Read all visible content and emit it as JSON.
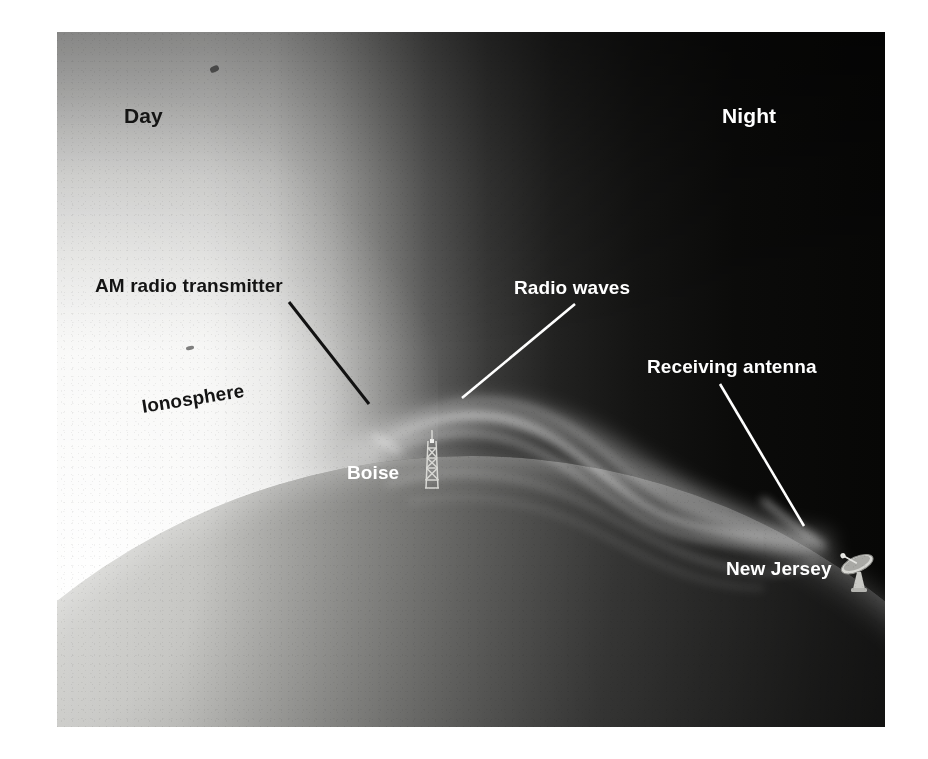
{
  "figure": {
    "type": "scientific-illustration",
    "palette": {
      "day_sky": "#f4f4f2",
      "night_sky": "#070706",
      "ionosphere_glow": "#ffffff",
      "land": "#2b2b2a",
      "ocean_lit": "#9a9a97",
      "label_dark": "#141414",
      "label_light": "#ffffff",
      "plate_border": "#ffffff"
    },
    "labels": [
      {
        "id": "day",
        "text": "Day",
        "tone": "dark",
        "x": 124,
        "y": 104
      },
      {
        "id": "night",
        "text": "Night",
        "tone": "light",
        "x": 722,
        "y": 104
      },
      {
        "id": "am-radio-transmitter",
        "text": "AM radio transmitter",
        "tone": "dark",
        "x": 95,
        "y": 275
      },
      {
        "id": "ionosphere",
        "text": "Ionosphere",
        "tone": "dark",
        "x": 142,
        "y": 396
      },
      {
        "id": "radio-waves",
        "text": "Radio waves",
        "tone": "light",
        "x": 514,
        "y": 277
      },
      {
        "id": "receiving-antenna",
        "text": "Receiving antenna",
        "tone": "light",
        "x": 647,
        "y": 356
      },
      {
        "id": "boise",
        "text": "Boise",
        "tone": "light",
        "x": 347,
        "y": 462
      },
      {
        "id": "new-jersey",
        "text": "New Jersey",
        "tone": "light",
        "x": 726,
        "y": 558
      }
    ],
    "leaders": [
      {
        "id": "am-radio-transmitter-leader",
        "color": "#121212",
        "from": [
          232,
          300
        ],
        "to": [
          372,
          402
        ]
      },
      {
        "id": "radio-waves-leader",
        "color": "#ffffff",
        "from": [
          516,
          302
        ],
        "to": [
          462,
          396
        ]
      },
      {
        "id": "receiving-antenna-leader",
        "color": "#ffffff",
        "from": [
          720,
          384
        ],
        "to": [
          800,
          522
        ]
      }
    ],
    "objects": [
      {
        "id": "am-transmitter-tower",
        "kind": "lattice-tower",
        "x": 362,
        "y": 398,
        "w": 26,
        "h": 60
      },
      {
        "id": "receiving-dish",
        "kind": "parabolic-dish",
        "x": 779,
        "y": 512,
        "w": 44,
        "h": 52
      }
    ],
    "day_label": "Day",
    "night_label": "Night"
  }
}
